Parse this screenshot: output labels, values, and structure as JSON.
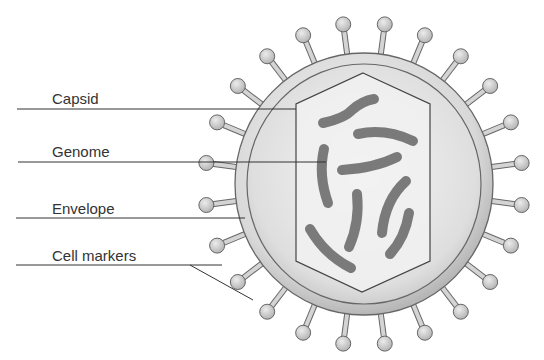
{
  "diagram": {
    "labels": [
      {
        "id": "capsid",
        "text": "Capsid",
        "x": 52,
        "y": 91,
        "line_y": 109,
        "line_x1": 17,
        "line_x2": 296
      },
      {
        "id": "genome",
        "text": "Genome",
        "x": 52,
        "y": 144,
        "line_y": 162,
        "line_x1": 18,
        "line_x2": 326
      },
      {
        "id": "envelope",
        "text": "Envelope",
        "x": 52,
        "y": 201,
        "line_y": 218,
        "line_x1": 16,
        "line_x2": 245
      },
      {
        "id": "cell-markers",
        "text": "Cell markers",
        "x": 52,
        "y": 248,
        "line_y": 265,
        "line_x1": 16,
        "line_x2": 222
      }
    ],
    "colors": {
      "line": "#333333",
      "text": "#333333",
      "envelope_fill": "#d6d6d6",
      "inner_fill": "#e4e4e4",
      "capsid_fill": "#f0f0f0",
      "genome": "#7a7a7a",
      "spike": "#c8c8c8",
      "outline": "#6a6a6a"
    }
  }
}
